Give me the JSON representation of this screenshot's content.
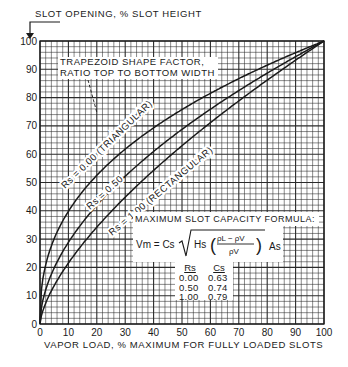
{
  "chart_data": {
    "type": "line",
    "title": "",
    "ylabel": "SLOT OPENING, % SLOT HEIGHT",
    "xlabel": "VAPOR LOAD, % MAXIMUM FOR FULLY LOADED SLOTS",
    "xlim": [
      0,
      100
    ],
    "ylim": [
      0,
      100
    ],
    "x_ticks": [
      0,
      10,
      20,
      30,
      40,
      50,
      60,
      70,
      80,
      90,
      100
    ],
    "y_ticks": [
      0,
      10,
      20,
      30,
      40,
      50,
      60,
      70,
      80,
      90,
      100
    ],
    "grid": true,
    "minor_grid_step": 2,
    "x": [
      0,
      1,
      2,
      5,
      10,
      15,
      20,
      30,
      40,
      50,
      60,
      70,
      80,
      90,
      100
    ],
    "series": [
      {
        "name": "Rs = 0.00 (TRIANGULAR)",
        "values": [
          0,
          15.8,
          20.9,
          30.2,
          39.8,
          46.8,
          52.5,
          61.8,
          69.3,
          75.8,
          81.5,
          86.7,
          91.5,
          95.9,
          100
        ]
      },
      {
        "name": "Rs = 0.50",
        "values": [
          0,
          7.6,
          11.5,
          18.8,
          27.9,
          34.9,
          40.9,
          51.1,
          59.9,
          67.6,
          74.6,
          81.1,
          87.9,
          94.0,
          100
        ]
      },
      {
        "name": "Rs = 1.00 (RECTANGULAR)",
        "values": [
          0,
          4.6,
          7.4,
          13.6,
          21.5,
          28.2,
          34.2,
          44.8,
          54.3,
          63.0,
          71.1,
          78.8,
          86.2,
          93.2,
          100
        ]
      }
    ],
    "annotations": [
      "TRAPEZOID SHAPE FACTOR, RATIO TOP TO BOTTOM WIDTH",
      "MAXIMUM SLOT CAPACITY FORMULA:",
      "Vm = Cs √( Hs ( (ρL − ρV) / ρV ) ) As"
    ],
    "table": {
      "columns": [
        "Rs",
        "Cs"
      ],
      "rows": [
        [
          "0.00",
          "0.63"
        ],
        [
          "0.50",
          "0.74"
        ],
        [
          "1.00",
          "0.79"
        ]
      ]
    }
  },
  "labels": {
    "y_axis_title": "SLOT OPENING, % SLOT HEIGHT",
    "x_axis_title": "VAPOR LOAD, % MAXIMUM FOR FULLY LOADED SLOTS",
    "shape_factor_line1": "TRAPEZOID SHAPE FACTOR,",
    "shape_factor_line2": "RATIO TOP TO BOTTOM WIDTH",
    "formula_title": "MAXIMUM SLOT CAPACITY FORMULA:",
    "curve_labels": [
      "Rs = 0.00 (TRIANGULAR)",
      "Rs = 0.50",
      "Rs = 1.00 (RECTANGULAR)"
    ],
    "formula": {
      "lhs": "Vm = Cs",
      "hs": "Hs",
      "num": "ρL − ρV",
      "den": "ρV",
      "as": "As"
    },
    "table_headers": [
      "Rs",
      "Cs"
    ],
    "table_rows": [
      [
        "0.00",
        "0.63"
      ],
      [
        "0.50",
        "0.74"
      ],
      [
        "1.00",
        "0.79"
      ]
    ]
  },
  "colors": {
    "ink": "#1a1a1a",
    "grid": "#2a2a2a",
    "background": "#ffffff"
  }
}
